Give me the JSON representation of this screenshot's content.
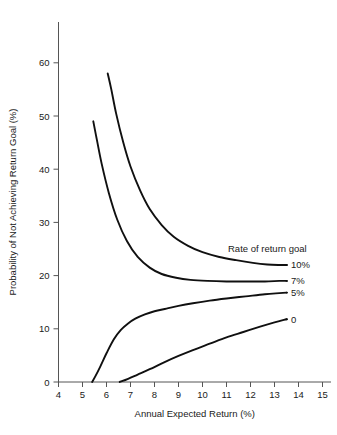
{
  "chart_data": {
    "type": "line",
    "title": "",
    "xlabel": "Annual Expected Return (%)",
    "ylabel": "Probability of Not Achieving Return Goal (%)",
    "xlim": [
      4,
      15
    ],
    "ylim": [
      0,
      60
    ],
    "xticks": [
      "4",
      "5",
      "6",
      "7",
      "8",
      "9",
      "10",
      "11",
      "12",
      "13",
      "14",
      "15"
    ],
    "yticks": [
      "0",
      "10",
      "20",
      "30",
      "40",
      "50",
      "60"
    ],
    "grid": false,
    "legend_position": "right-inline",
    "legend_title": "Rate of return goal",
    "series": [
      {
        "name": "10%",
        "label": "10%",
        "x": [
          6.05,
          6.2,
          6.4,
          6.7,
          7.0,
          7.4,
          7.8,
          8.3,
          8.8,
          9.4,
          10.0,
          10.7,
          11.4,
          12.1,
          12.7,
          13.2,
          13.5
        ],
        "values": [
          58.0,
          55.0,
          50.5,
          45.0,
          40.5,
          36.0,
          32.5,
          29.5,
          27.3,
          25.6,
          24.4,
          23.5,
          22.9,
          22.4,
          22.1,
          22.0,
          22.0
        ]
      },
      {
        "name": "7%",
        "label": "7%",
        "x": [
          5.45,
          5.6,
          5.8,
          6.1,
          6.45,
          6.85,
          7.3,
          7.8,
          8.3,
          8.9,
          9.5,
          10.2,
          11.0,
          11.8,
          12.6,
          13.2,
          13.5
        ],
        "values": [
          49.0,
          45.5,
          41.0,
          35.5,
          30.5,
          26.5,
          23.5,
          21.5,
          20.3,
          19.6,
          19.2,
          19.0,
          18.9,
          18.9,
          18.9,
          19.0,
          19.0
        ]
      },
      {
        "name": "5%",
        "label": "5%",
        "x": [
          5.4,
          5.55,
          5.75,
          6.0,
          6.3,
          6.6,
          6.9,
          7.2,
          7.6,
          8.0,
          8.5,
          9.0,
          9.6,
          10.3,
          11.0,
          11.8,
          12.6,
          13.2,
          13.5
        ],
        "values": [
          0.0,
          1.2,
          3.0,
          5.4,
          8.0,
          9.8,
          11.0,
          11.9,
          12.7,
          13.3,
          13.8,
          14.3,
          14.8,
          15.3,
          15.7,
          16.1,
          16.5,
          16.7,
          16.8
        ]
      },
      {
        "name": "0",
        "label": "0",
        "x": [
          6.55,
          6.9,
          7.3,
          7.8,
          8.4,
          9.0,
          9.6,
          10.3,
          11.0,
          11.7,
          12.4,
          13.0,
          13.5
        ],
        "values": [
          0.0,
          0.6,
          1.4,
          2.4,
          3.7,
          4.9,
          6.0,
          7.2,
          8.4,
          9.4,
          10.4,
          11.2,
          11.8
        ]
      }
    ]
  },
  "axes": {
    "x_title": "Annual Expected Return (%)",
    "y_title": "Probability of Not Achieving Return Goal (%)"
  },
  "legend": {
    "title": "Rate of return goal",
    "entries": [
      "10%",
      "7%",
      "5%",
      "0"
    ]
  },
  "colors": {
    "curve": "#101010",
    "axis": "#555555",
    "text": "#1a1a1a",
    "background": "#ffffff"
  }
}
